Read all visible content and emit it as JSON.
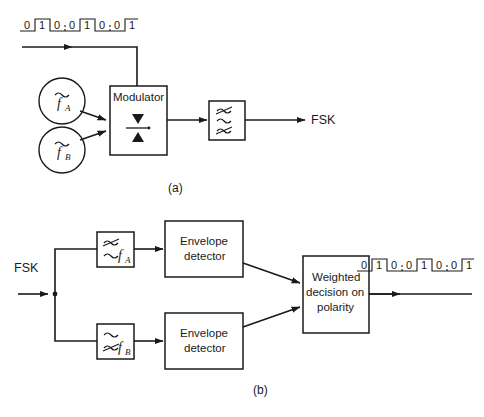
{
  "figure": {
    "stroke_color": "#1a1a1a",
    "background_color": "#ffffff"
  },
  "part_a": {
    "caption": "(a)",
    "input_bitstream": {
      "name": "input-binary-sequence",
      "bits": [
        "0",
        "1",
        "0",
        "0",
        "1",
        "0",
        "0",
        "1"
      ]
    },
    "oscillator_a": {
      "symbol": "~",
      "label": "f",
      "subscript": "A"
    },
    "oscillator_b": {
      "symbol": "~",
      "label": "f",
      "subscript": "B"
    },
    "modulator": {
      "label": "Modulator",
      "symbol_name": "balanced-mixer-symbol"
    },
    "bandpass_filter": {
      "symbol_name": "bandpass-filter-symbol",
      "bands": [
        "rejected",
        "passed",
        "rejected"
      ]
    },
    "output_label": "FSK"
  },
  "part_b": {
    "caption": "(b)",
    "input_label": "FSK",
    "filter_a": {
      "symbol_name": "bandpass-filter-symbol",
      "label": "f",
      "subscript": "A",
      "bands": [
        "rejected",
        "passed"
      ]
    },
    "filter_b": {
      "symbol_name": "bandpass-filter-symbol",
      "label": "f",
      "subscript": "B",
      "bands": [
        "passed",
        "rejected"
      ]
    },
    "envelope_detector_a": {
      "line1": "Envelope",
      "line2": "detector"
    },
    "envelope_detector_b": {
      "line1": "Envelope",
      "line2": "detector"
    },
    "decision_block": {
      "line1": "Weighted",
      "line2": "decision on",
      "line3": "polarity"
    },
    "output_bitstream": {
      "name": "output-binary-sequence",
      "bits": [
        "0",
        "1",
        "0",
        "0",
        "1",
        "0",
        "0",
        "1"
      ]
    }
  }
}
